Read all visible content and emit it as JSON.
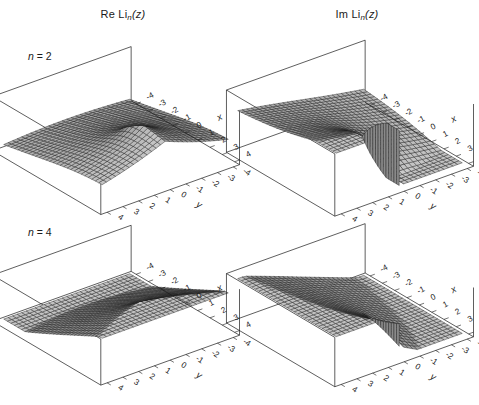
{
  "figure": {
    "width": 479,
    "height": 405,
    "background": "#ffffff",
    "ink": "#1a1a1a"
  },
  "panels": [
    {
      "id": "re-n2",
      "title_prefix": "Re Li",
      "title_sub": "n",
      "title_suffix": "(z)",
      "part": "Re",
      "n_label_prefix": "n",
      "n_label_eq": " = ",
      "n_label_value": "2",
      "n": 2,
      "show_n_label": true,
      "box": {
        "left": 6,
        "top": 6,
        "width": 234,
        "height": 198
      }
    },
    {
      "id": "im-n2",
      "title_prefix": "Im Li",
      "title_sub": "n",
      "title_suffix": "(z)",
      "part": "Im",
      "n_label_prefix": "n",
      "n_label_eq": " = ",
      "n_label_value": "2",
      "n": 2,
      "show_n_label": false,
      "box": {
        "left": 240,
        "top": 6,
        "width": 234,
        "height": 198
      }
    },
    {
      "id": "re-n4",
      "title_prefix": "",
      "title_sub": "",
      "title_suffix": "",
      "part": "Re",
      "n_label_prefix": "n",
      "n_label_eq": " = ",
      "n_label_value": "4",
      "n": 4,
      "show_n_label": true,
      "box": {
        "left": 6,
        "top": 200,
        "width": 234,
        "height": 200
      }
    },
    {
      "id": "im-n4",
      "title_prefix": "",
      "title_sub": "",
      "title_suffix": "",
      "part": "Im",
      "n_label_prefix": "n",
      "n_label_eq": " = ",
      "n_label_value": "4",
      "n": 4,
      "show_n_label": false,
      "box": {
        "left": 240,
        "top": 200,
        "width": 234,
        "height": 200
      }
    }
  ],
  "chart_data": {
    "type": "surface",
    "panel_titles": [
      "Re Li_n(z)",
      "Im Li_n(z)"
    ],
    "row_labels": [
      "n = 2",
      "n = 4"
    ],
    "xlabel": "x",
    "ylabel": "y",
    "zlabel": "",
    "xlim": [
      -4,
      4
    ],
    "ylim": [
      -4,
      4
    ],
    "xticks": [
      -4,
      -3,
      -2,
      -1,
      0,
      1,
      2,
      3,
      4
    ],
    "yticks": [
      4,
      3,
      2,
      1,
      0,
      -1,
      -2,
      -3,
      -4
    ],
    "xtick_labels": [
      "-4",
      "-3",
      "-2",
      "-1",
      "0",
      "1",
      "2",
      "3",
      "4"
    ],
    "ytick_labels": [
      "4",
      "3",
      "2",
      "1",
      "0",
      "-1",
      "-2",
      "-3",
      "-4"
    ],
    "grid": false,
    "legend": false,
    "mesh_n": 28,
    "surface_fill": "#9d9d9d",
    "surface_stroke": "#1a1a1a",
    "box_stroke": "#1a1a1a",
    "branch_cut": {
      "x_start": 1,
      "x_end": 4,
      "y": 0,
      "note": "discontinuity of Im Li_n along the real axis for x>1"
    },
    "series": [
      {
        "name": "Re Li_2(z)",
        "part": "Re",
        "n": 2,
        "zlim": [
          -3.2,
          2.6
        ]
      },
      {
        "name": "Im Li_2(z)",
        "part": "Im",
        "n": 2,
        "zlim": [
          -3.4,
          3.4
        ]
      },
      {
        "name": "Re Li_4(z)",
        "part": "Re",
        "n": 4,
        "zlim": [
          -2.4,
          2.4
        ]
      },
      {
        "name": "Im Li_4(z)",
        "part": "Im",
        "n": 4,
        "zlim": [
          -2.6,
          2.6
        ]
      }
    ]
  },
  "view": {
    "azimuth_deg": 52,
    "elevation_deg": 26,
    "projection": "orthographic"
  }
}
